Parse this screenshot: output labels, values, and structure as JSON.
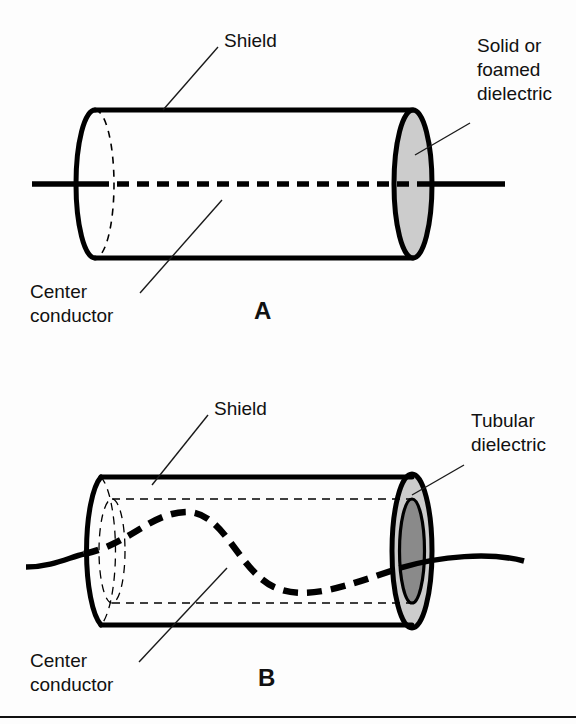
{
  "figure": {
    "background_color": "#fdfdfd",
    "line_color": "#000000",
    "dielectric_fill": "#cccccc",
    "core_fill": "#8a8a8a"
  },
  "panels": [
    {
      "id": "A",
      "letter": "A",
      "description": "Coaxial cable with solid or foamed dielectric",
      "labels": {
        "shield": "Shield",
        "center_conductor_line1": "Center",
        "center_conductor_line2": "conductor",
        "dielectric_line1": "Solid or",
        "dielectric_line2": "foamed",
        "dielectric_line3": "dielectric"
      }
    },
    {
      "id": "B",
      "letter": "B",
      "description": "Coaxial cable with tubular dielectric and air core",
      "labels": {
        "shield": "Shield",
        "center_conductor_line1": "Center",
        "center_conductor_line2": "conductor",
        "dielectric_line1": "Tubular",
        "dielectric_line2": "dielectric"
      }
    }
  ]
}
